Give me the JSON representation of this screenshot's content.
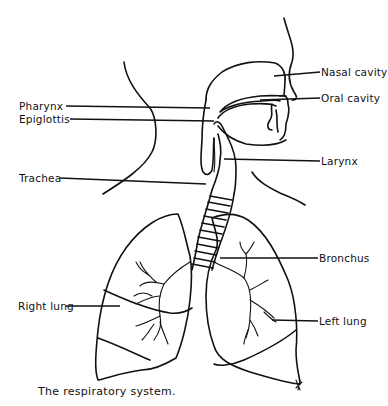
{
  "diagram": {
    "title": "The respiratory system.",
    "labels": {
      "nasal_cavity": "Nasal cavity",
      "oral_cavity": "Oral cavity",
      "pharynx": "Pharynx",
      "epiglottis": "Epiglottis",
      "larynx": "Larynx",
      "trachea": "Trachea",
      "bronchus": "Bronchus",
      "right_lung": "Right lung",
      "left_lung": "Left lung"
    },
    "colors": {
      "line": "#111111",
      "background": "#ffffff"
    }
  }
}
